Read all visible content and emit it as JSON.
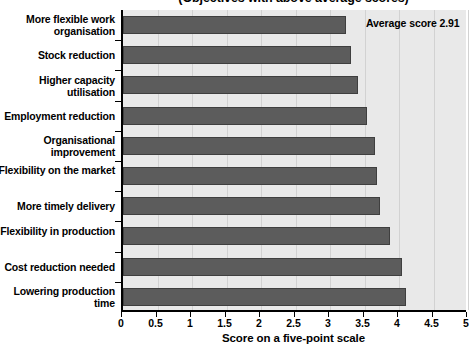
{
  "chart_data": {
    "type": "bar",
    "orientation": "horizontal",
    "title": "(Objectives with above average scores)",
    "xlabel": "Score on a five-point scale",
    "ylabel": "",
    "xlim": [
      0,
      5
    ],
    "xticks": [
      "0",
      "0.5",
      "1",
      "1.5",
      "2",
      "2.5",
      "3",
      "3.5",
      "4",
      "4.5",
      "5"
    ],
    "xtick_values": [
      0,
      0.5,
      1,
      1.5,
      2,
      2.5,
      3,
      3.5,
      4,
      4.5,
      5
    ],
    "grid": true,
    "legend": "none",
    "categories": [
      "More flexible work organisation",
      "Stock reduction",
      "Higher capacity utilisation",
      "Employment reduction",
      "Organisational improvement",
      "Flexibility on the market",
      "More timely delivery",
      "Flexibility in production",
      "Cost reduction needed",
      "Lowering production time"
    ],
    "values": [
      3.23,
      3.31,
      3.4,
      3.53,
      3.65,
      3.68,
      3.73,
      3.87,
      4.05,
      4.1
    ],
    "annotations": [
      "Average score 2.91"
    ],
    "bar_color": "#5c5c5c",
    "plot_background": "#e9e9e9"
  },
  "annotation": {
    "average_score_label": "Average score 2.91"
  }
}
